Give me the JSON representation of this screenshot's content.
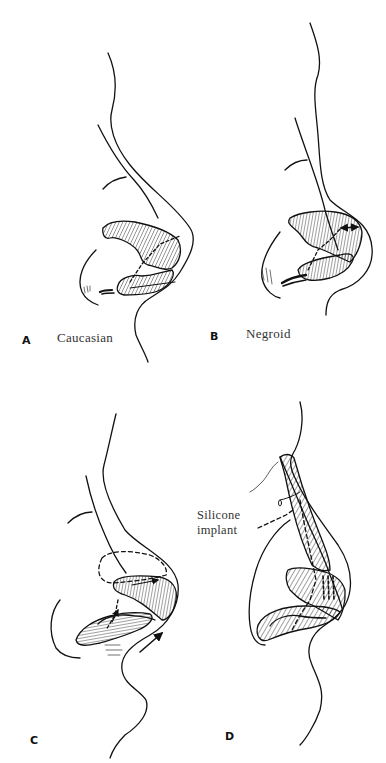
{
  "figure": {
    "panels": [
      {
        "id": "A",
        "letter": "A",
        "caption": "Caucasian"
      },
      {
        "id": "B",
        "letter": "B",
        "caption": "Negroid"
      },
      {
        "id": "C",
        "letter": "C",
        "caption": ""
      },
      {
        "id": "D",
        "letter": "D",
        "caption": ""
      }
    ],
    "annotations": {
      "silicone_implant_line1": "Silicone",
      "silicone_implant_line2": "implant"
    },
    "colors": {
      "ink": "#111111",
      "caption": "#333333",
      "background": "#ffffff"
    }
  }
}
